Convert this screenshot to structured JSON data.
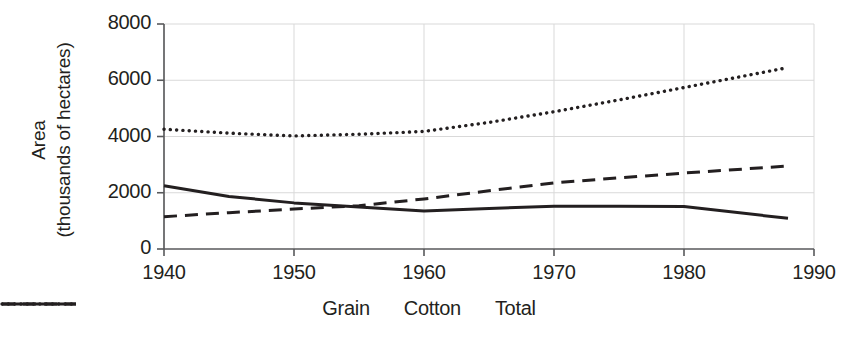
{
  "chart_data": {
    "type": "line",
    "title": "",
    "xlabel": "",
    "ylabel": "Area (thousands of hectares)",
    "ylabel_line1": "Area",
    "ylabel_line2": "(thousands of hectares)",
    "xlim": [
      1940,
      1990
    ],
    "ylim": [
      0,
      8000
    ],
    "xticks": [
      "1940",
      "1950",
      "1960",
      "1970",
      "1980",
      "1990"
    ],
    "xtick_values": [
      1940,
      1950,
      1960,
      1970,
      1980,
      1990
    ],
    "yticks": [
      "0",
      "2000",
      "4000",
      "6000",
      "8000"
    ],
    "ytick_values": [
      0,
      2000,
      4000,
      6000,
      8000
    ],
    "grid": true,
    "grid_color": "#d9d9d9",
    "legend_position": "bottom",
    "line_color": "#231f20",
    "x": [
      1940,
      1945,
      1950,
      1955,
      1960,
      1965,
      1970,
      1975,
      1980,
      1988
    ],
    "series": [
      {
        "name": "Grain",
        "style": "solid",
        "values": [
          2250,
          1870,
          1640,
          1490,
          1350,
          1440,
          1520,
          1520,
          1510,
          1090
        ]
      },
      {
        "name": "Cotton",
        "style": "dashed",
        "values": [
          1150,
          1290,
          1420,
          1540,
          1780,
          2070,
          2350,
          2530,
          2700,
          2950
        ]
      },
      {
        "name": "Total",
        "style": "dotted",
        "values": [
          4260,
          4120,
          4020,
          4080,
          4180,
          4500,
          4880,
          5300,
          5740,
          6450
        ]
      }
    ]
  },
  "legend": {
    "items": [
      {
        "label": "Grain",
        "style": "solid"
      },
      {
        "label": "Cotton",
        "style": "dashed"
      },
      {
        "label": "Total",
        "style": "dotted"
      }
    ]
  }
}
